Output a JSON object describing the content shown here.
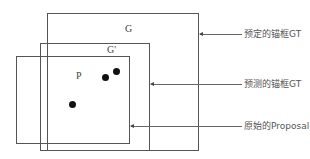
{
  "boxes": {
    "g": {
      "label": "G"
    },
    "g_prime": {
      "label": "G'"
    },
    "p": {
      "label": "P"
    }
  },
  "annotations": [
    {
      "text": "预定的锚框GT",
      "target": "G"
    },
    {
      "text": "预测的锚框GT",
      "target": "G'"
    },
    {
      "text": "原始的Proposal",
      "target": "P"
    }
  ],
  "points": [
    {
      "x": 72,
      "y": 104
    },
    {
      "x": 105,
      "y": 77
    },
    {
      "x": 116,
      "y": 71
    }
  ]
}
